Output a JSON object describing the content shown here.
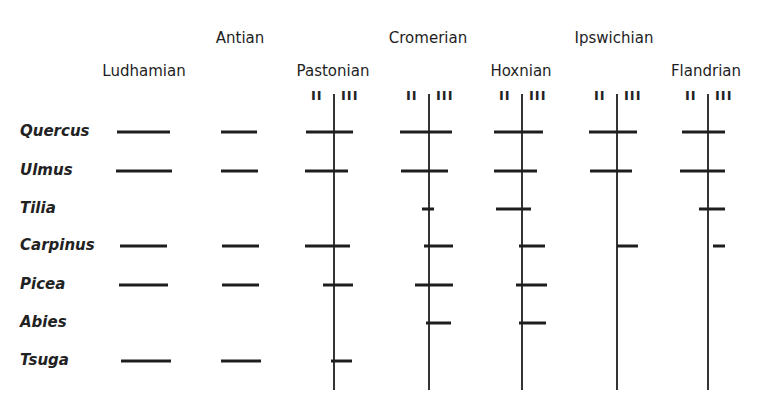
{
  "stages": [
    {
      "name": "Ludhamian",
      "x": 144,
      "y": 64,
      "divider": null
    },
    {
      "name": "Antian",
      "x": 240,
      "y": 31,
      "divider": null
    },
    {
      "name": "Pastonian",
      "x": 333,
      "y": 64,
      "divider": 334
    },
    {
      "name": "Cromerian",
      "x": 428,
      "y": 31,
      "divider": 429
    },
    {
      "name": "Hoxnian",
      "x": 521,
      "y": 64,
      "divider": 522
    },
    {
      "name": "Ipswichian",
      "x": 614,
      "y": 31,
      "divider": 617
    },
    {
      "name": "Flandrian",
      "x": 706,
      "y": 64,
      "divider": 708
    }
  ],
  "substage_labels": {
    "left": "II",
    "right": "III"
  },
  "species": [
    {
      "name": "Quercus",
      "y": 132
    },
    {
      "name": "Ulmus",
      "y": 171
    },
    {
      "name": "Tilia",
      "y": 209
    },
    {
      "name": "Carpinus",
      "y": 246
    },
    {
      "name": "Picea",
      "y": 285
    },
    {
      "name": "Abies",
      "y": 323
    },
    {
      "name": "Tsuga",
      "y": 361
    }
  ],
  "divider_range": {
    "top": 94,
    "bottom": 390
  },
  "colors": {
    "ink": "#1e1e1e",
    "background": "#ffffff"
  },
  "chart_data": {
    "type": "table",
    "columns": [
      "Ludhamian",
      "Antian",
      "Pastonian",
      "Cromerian",
      "Hoxnian",
      "Ipswichian",
      "Flandrian"
    ],
    "rows": [
      "Quercus",
      "Ulmus",
      "Tilia",
      "Carpinus",
      "Picea",
      "Abies",
      "Tsuga"
    ],
    "bars": [
      {
        "species": "Quercus",
        "stage": "Ludhamian",
        "x1": 117,
        "x2": 170
      },
      {
        "species": "Quercus",
        "stage": "Antian",
        "x1": 221,
        "x2": 257
      },
      {
        "species": "Quercus",
        "stage": "Pastonian",
        "x1": 306,
        "x2": 353
      },
      {
        "species": "Quercus",
        "stage": "Cromerian",
        "x1": 400,
        "x2": 452
      },
      {
        "species": "Quercus",
        "stage": "Hoxnian",
        "x1": 494,
        "x2": 543
      },
      {
        "species": "Quercus",
        "stage": "Ipswichian",
        "x1": 589,
        "x2": 637
      },
      {
        "species": "Quercus",
        "stage": "Flandrian",
        "x1": 682,
        "x2": 725
      },
      {
        "species": "Ulmus",
        "stage": "Ludhamian",
        "x1": 116,
        "x2": 172
      },
      {
        "species": "Ulmus",
        "stage": "Antian",
        "x1": 221,
        "x2": 258
      },
      {
        "species": "Ulmus",
        "stage": "Pastonian",
        "x1": 305,
        "x2": 348
      },
      {
        "species": "Ulmus",
        "stage": "Cromerian",
        "x1": 401,
        "x2": 448
      },
      {
        "species": "Ulmus",
        "stage": "Hoxnian",
        "x1": 494,
        "x2": 537
      },
      {
        "species": "Ulmus",
        "stage": "Ipswichian",
        "x1": 590,
        "x2": 632
      },
      {
        "species": "Ulmus",
        "stage": "Flandrian",
        "x1": 680,
        "x2": 725
      },
      {
        "species": "Tilia",
        "stage": "Cromerian",
        "x1": 422,
        "x2": 434
      },
      {
        "species": "Tilia",
        "stage": "Hoxnian",
        "x1": 496,
        "x2": 531
      },
      {
        "species": "Tilia",
        "stage": "Flandrian",
        "x1": 699,
        "x2": 725
      },
      {
        "species": "Carpinus",
        "stage": "Ludhamian",
        "x1": 120,
        "x2": 167
      },
      {
        "species": "Carpinus",
        "stage": "Antian",
        "x1": 222,
        "x2": 259
      },
      {
        "species": "Carpinus",
        "stage": "Pastonian",
        "x1": 305,
        "x2": 350
      },
      {
        "species": "Carpinus",
        "stage": "Cromerian",
        "x1": 424,
        "x2": 453
      },
      {
        "species": "Carpinus",
        "stage": "Hoxnian",
        "x1": 519,
        "x2": 545
      },
      {
        "species": "Carpinus",
        "stage": "Ipswichian",
        "x1": 617,
        "x2": 638
      },
      {
        "species": "Carpinus",
        "stage": "Flandrian",
        "x1": 713,
        "x2": 725
      },
      {
        "species": "Picea",
        "stage": "Ludhamian",
        "x1": 119,
        "x2": 168
      },
      {
        "species": "Picea",
        "stage": "Antian",
        "x1": 222,
        "x2": 259
      },
      {
        "species": "Picea",
        "stage": "Pastonian",
        "x1": 323,
        "x2": 353
      },
      {
        "species": "Picea",
        "stage": "Cromerian",
        "x1": 415,
        "x2": 453
      },
      {
        "species": "Picea",
        "stage": "Hoxnian",
        "x1": 516,
        "x2": 547
      },
      {
        "species": "Abies",
        "stage": "Cromerian",
        "x1": 426,
        "x2": 451
      },
      {
        "species": "Abies",
        "stage": "Hoxnian",
        "x1": 519,
        "x2": 546
      },
      {
        "species": "Tsuga",
        "stage": "Ludhamian",
        "x1": 121,
        "x2": 171
      },
      {
        "species": "Tsuga",
        "stage": "Antian",
        "x1": 221,
        "x2": 261
      },
      {
        "species": "Tsuga",
        "stage": "Pastonian",
        "x1": 331,
        "x2": 352
      }
    ]
  }
}
